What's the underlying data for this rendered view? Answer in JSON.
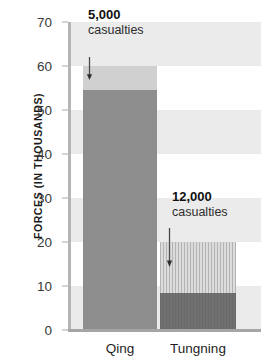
{
  "chart_data": {
    "type": "bar",
    "title": "",
    "subtitle": "",
    "xlabel": "",
    "ylabel": "FORCES (IN THOUSANDS)",
    "ylim": [
      0,
      70
    ],
    "ytick_step": 10,
    "yticks": [
      0,
      10,
      20,
      30,
      40,
      50,
      60,
      70
    ],
    "ytick_labels": [
      "0",
      "10",
      "20",
      "30",
      "40",
      "50",
      "60",
      "70"
    ],
    "grid": "horizontal-bands",
    "legend": "none",
    "stacked": true,
    "categories": [
      "Qing",
      "Tungning"
    ],
    "series": [
      {
        "name": "surviving forces",
        "values": [
          54.5,
          8.5
        ]
      },
      {
        "name": "casualties",
        "values": [
          5.5,
          11.5
        ]
      }
    ],
    "totals": [
      60,
      20
    ],
    "annotations": [
      {
        "category": "Qing",
        "value": "5,000",
        "label": "casualties",
        "points_to": 57
      },
      {
        "category": "Tungning",
        "value": "12,000",
        "label": "casualties",
        "points_to": 17
      }
    ],
    "colors": {
      "qing_solid": "#8e8e8e",
      "qing_cap": "#d0d0d0",
      "tungning_solid": "#707070",
      "tungning_cap": "#dcdcdc",
      "band": "#ebebeb",
      "axis": "#b5b5b5",
      "text": "#1b1b1b",
      "background": "#ffffff"
    }
  },
  "axis": {
    "y_title": "FORCES (IN THOUSANDS)",
    "ticks": [
      "70",
      "60",
      "50",
      "40",
      "30",
      "20",
      "10",
      "0"
    ]
  },
  "categories": {
    "first": "Qing",
    "second": "Tungning"
  },
  "annotations": {
    "qing": {
      "value": "5,000",
      "label": "casualties"
    },
    "tungning": {
      "value": "12,000",
      "label": "casualties"
    }
  }
}
